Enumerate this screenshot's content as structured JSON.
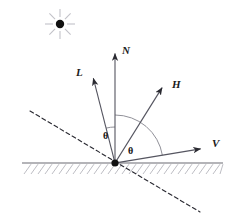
{
  "figure": {
    "background_color": "#ffffff",
    "line_color": "#555560",
    "ground_color": "#6b6b72",
    "hatch_color": "#b9b9c0",
    "label_color": "#1a1a1a",
    "arc_color": "#8a8a92",
    "dash_color": "#2b2b33"
  },
  "light_source": {
    "name": "light-source",
    "center_x": 60,
    "center_y": 24,
    "dot_radius": 4.2,
    "ray_count": 8,
    "ray_inner": 7,
    "ray_outer": 15,
    "ray_color": "#c2c2c8",
    "dot_color": "#111111"
  },
  "origin": {
    "x": 115,
    "y": 163,
    "radius": 3.6
  },
  "ground": {
    "name": "surface-line",
    "x1": 22,
    "x2": 223,
    "y": 163,
    "hatch_spacing": 7,
    "hatch_height": 11,
    "hatch_slant": 7
  },
  "dashed_line": {
    "name": "surface-normal-tangent-dashed",
    "x1": 30,
    "y1": 111,
    "x2": 200,
    "y2": 212,
    "dash_pattern": "4 3"
  },
  "vectors": [
    {
      "id": "L",
      "name": "vector-L",
      "label": "L",
      "tip_x": 92,
      "tip_y": 73,
      "label_x": 76,
      "label_y": 76,
      "description": "light direction vector"
    },
    {
      "id": "N",
      "name": "vector-N",
      "label": "N",
      "tip_x": 115,
      "tip_y": 48,
      "label_x": 122,
      "label_y": 54,
      "description": "surface normal vector"
    },
    {
      "id": "H",
      "name": "vector-H",
      "label": "H",
      "tip_x": 165,
      "tip_y": 83,
      "label_x": 172,
      "label_y": 88,
      "description": "halfway vector"
    },
    {
      "id": "V",
      "name": "vector-V",
      "label": "V",
      "tip_x": 206,
      "tip_y": 148,
      "label_x": 212,
      "label_y": 147,
      "description": "view direction vector"
    }
  ],
  "angles": [
    {
      "id": "theta-left",
      "name": "angle-theta-incident",
      "label": "θ",
      "radius": 36,
      "from_vector": "L",
      "to_vector": "N",
      "label_x": 103,
      "label_y": 139,
      "description": "angle between L and N"
    },
    {
      "id": "theta-right",
      "name": "angle-theta-reflected",
      "label": "θ",
      "radius": 48,
      "from_vector": "N",
      "to_vector": "V",
      "label_x": 128,
      "label_y": 154,
      "description": "angle between N and V"
    }
  ]
}
